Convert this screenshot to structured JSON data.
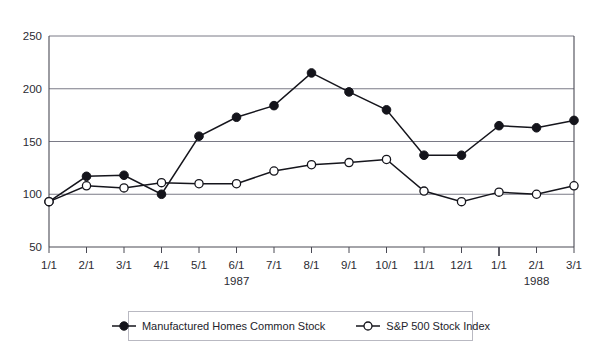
{
  "chart_data": {
    "type": "line",
    "title": "",
    "xlabel": "",
    "ylabel": "",
    "ylim": [
      50,
      250
    ],
    "yticks": [
      50,
      100,
      150,
      200,
      250
    ],
    "grid": true,
    "legend_position": "bottom",
    "categories": [
      "1/1",
      "2/1",
      "3/1",
      "4/1",
      "5/1",
      "6/1",
      "7/1",
      "8/1",
      "9/1",
      "10/1",
      "11/1",
      "12/1",
      "1/1",
      "2/1",
      "3/1"
    ],
    "group_labels": [
      {
        "label": "1987",
        "at_category": "6/1"
      },
      {
        "label": "1988",
        "at_category": "2/1"
      }
    ],
    "series": [
      {
        "name": "Manufactured Homes Common Stock",
        "marker": "filled-circle",
        "color": "#14141b",
        "values": [
          93,
          117,
          118,
          100,
          155,
          173,
          184,
          215,
          197,
          180,
          137,
          137,
          165,
          163,
          170
        ]
      },
      {
        "name": "S&P 500 Stock Index",
        "marker": "open-circle",
        "color": "#14141b",
        "values": [
          93,
          108,
          106,
          111,
          110,
          110,
          122,
          128,
          130,
          133,
          103,
          93,
          102,
          100,
          108
        ]
      }
    ]
  },
  "axis": {
    "ytick_labels": [
      "50",
      "100",
      "150",
      "200",
      "250"
    ],
    "xtick_labels": [
      "1/1",
      "2/1",
      "3/1",
      "4/1",
      "5/1",
      "6/1",
      "7/1",
      "8/1",
      "9/1",
      "10/1",
      "11/1",
      "12/1",
      "1/1",
      "2/1",
      "3/1"
    ],
    "year_labels": [
      "1987",
      "1988"
    ]
  },
  "legend": {
    "entries": [
      {
        "label": "Manufactured Homes Common Stock",
        "marker": "filled-circle"
      },
      {
        "label": "S&P 500 Stock Index",
        "marker": "open-circle"
      }
    ]
  }
}
